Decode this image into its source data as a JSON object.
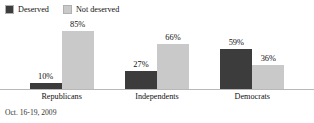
{
  "chart_data": {
    "type": "bar",
    "title": "",
    "subtitle": "",
    "xlabel": "",
    "ylabel": "",
    "ylim": [
      0,
      100
    ],
    "grid": false,
    "legend_position": "top-left",
    "categories": [
      "Republicans",
      "Independents",
      "Democrats"
    ],
    "series": [
      {
        "name": "Deserved",
        "color": "#3c3c3c",
        "values": [
          10,
          27,
          59
        ],
        "labels": [
          "10%",
          "27%",
          "59%"
        ]
      },
      {
        "name": "Not deserved",
        "color": "#c9c9c9",
        "values": [
          85,
          66,
          36
        ],
        "labels": [
          "85%",
          "66%",
          "36%"
        ]
      }
    ],
    "annotations": [
      "Oct. 16-19, 2009"
    ]
  },
  "legend": {
    "items": [
      {
        "label": "Deserved",
        "color": "#3c3c3c"
      },
      {
        "label": "Not deserved",
        "color": "#c9c9c9"
      }
    ]
  },
  "footnote": {
    "text": "Oct. 16-19, 2009"
  }
}
